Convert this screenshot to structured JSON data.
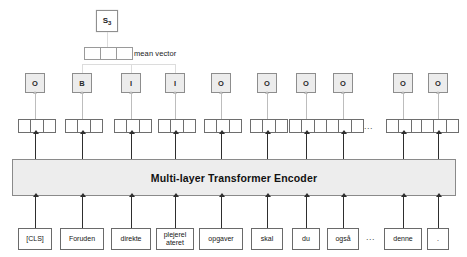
{
  "figure": {
    "encoder_label": "Multi-layer Transformer Encoder",
    "mean_vector_label": "mean vector",
    "sentence_repr": "S",
    "sentence_repr_sub": "3",
    "ellipsis": "...",
    "colors": {
      "tag_fill": "#ececec",
      "encoder_fill": "#ededed",
      "box_stroke": "#6a6a6a",
      "faint_stroke": "#dcdcdc",
      "arrow": "#2e2e2e"
    }
  },
  "columns": [
    {
      "token": "[CLS]",
      "tag": "O",
      "width": 34,
      "center": 35,
      "in_mean": false
    },
    {
      "token": "Foruden",
      "tag": "B",
      "width": 44,
      "center": 82,
      "in_mean": true
    },
    {
      "token": "direkte",
      "tag": "I",
      "width": 40,
      "center": 131,
      "in_mean": true
    },
    {
      "token": "plejerel\nateret",
      "tag": "I",
      "width": 38,
      "center": 175,
      "in_mean": true
    },
    {
      "token": "opgaver",
      "tag": "O",
      "width": 44,
      "center": 221,
      "in_mean": false
    },
    {
      "token": "skal",
      "tag": "O",
      "width": 32,
      "center": 267,
      "in_mean": false
    },
    {
      "token": "du",
      "tag": "O",
      "width": 28,
      "center": 306,
      "in_mean": false
    },
    {
      "token": "også",
      "tag": "O",
      "width": 32,
      "center": 343,
      "in_mean": false
    },
    {
      "token": "denne",
      "tag": "O",
      "width": 38,
      "center": 403,
      "in_mean": false
    },
    {
      "token": ".",
      "tag": "O",
      "width": 22,
      "center": 438,
      "in_mean": false
    }
  ],
  "ellipsis_positions": {
    "vector_row_x": 369,
    "word_row_x": 371
  },
  "rows": {
    "sentence_y": 10,
    "mean_y": 47,
    "tag_y": 73,
    "vector_y": 119,
    "encoder_y": 159,
    "word_y": 228
  }
}
